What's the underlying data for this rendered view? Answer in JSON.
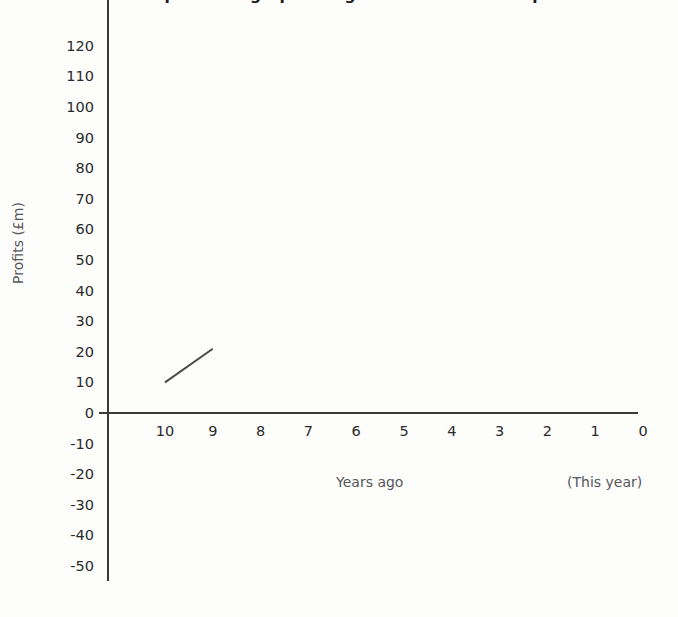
{
  "chart_data": {
    "type": "line",
    "title": "Complete the graph using the information on pa",
    "xlabel": "Years ago",
    "ylabel": "Profits (£m)",
    "x_note": "(This year)",
    "grid": false,
    "legend": "none",
    "xlim": [
      10,
      0
    ],
    "ylim": [
      -50,
      120
    ],
    "x_ticks": [
      "10",
      "9",
      "8",
      "7",
      "6",
      "5",
      "4",
      "3",
      "2",
      "1",
      "0"
    ],
    "y_ticks": [
      "120",
      "110",
      "100",
      "90",
      "80",
      "70",
      "60",
      "50",
      "40",
      "30",
      "20",
      "10",
      "0",
      "-10",
      "-20",
      "-30",
      "-40",
      "-50"
    ],
    "series": [
      {
        "name": "Profits",
        "x": [
          10,
          9
        ],
        "values": [
          10,
          21
        ]
      }
    ],
    "annotations": []
  },
  "style": {
    "axis_color": "#3a3a3a",
    "tick_text_color": "#2a2a2a",
    "label_color": "#57575a",
    "title_color": "#1c1c1c",
    "series_color": "#4a4a4a",
    "background": "#fdfdfc"
  }
}
